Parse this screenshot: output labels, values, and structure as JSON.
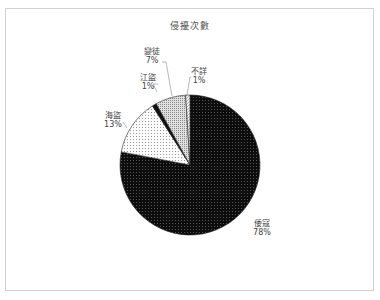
{
  "chart_data": {
    "type": "pie",
    "title": "侵擾次數",
    "categories": [
      "倭寇",
      "海盜",
      "江盜",
      "變徒",
      "不詳"
    ],
    "values": [
      78,
      13,
      1,
      7,
      1
    ],
    "labels": [
      "78%",
      "13%",
      "1%",
      "7%",
      "1%"
    ],
    "start_angle_deg": 0,
    "direction": "clockwise",
    "fills": [
      "#111111",
      "#f4f4f4",
      "#111111",
      "#c8c8c8",
      "#e8e8e8"
    ],
    "legend": "none",
    "data_labels": "category and percentage, outside with leader lines"
  }
}
